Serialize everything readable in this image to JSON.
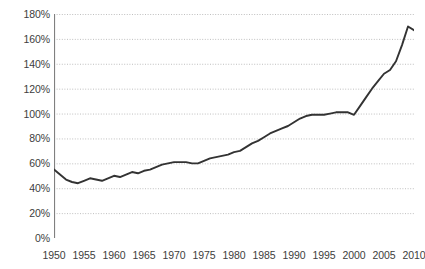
{
  "chart_data": {
    "type": "line",
    "title": "",
    "subtitle": "",
    "xlabel": "",
    "ylabel": "",
    "xlim": [
      1950,
      2010
    ],
    "ylim": [
      0,
      180
    ],
    "ytick_step": 20,
    "ytick_labels": [
      "0%",
      "20%",
      "40%",
      "60%",
      "80%",
      "100%",
      "120%",
      "140%",
      "160%",
      "180%"
    ],
    "ytick_values": [
      0,
      20,
      40,
      60,
      80,
      100,
      120,
      140,
      160,
      180
    ],
    "xtick_labels": [
      "1950",
      "1955",
      "1960",
      "1965",
      "1970",
      "1975",
      "1980",
      "1985",
      "1990",
      "1995",
      "2000",
      "2005",
      "2010"
    ],
    "xtick_values": [
      1950,
      1955,
      1960,
      1965,
      1970,
      1975,
      1980,
      1985,
      1990,
      1995,
      2000,
      2005,
      2010
    ],
    "xminor_tick_step": 1,
    "grid": "horizontal-dotted",
    "legend": "none",
    "line_color": "#333333",
    "grid_color": "#bfbfbf",
    "axis_color": "#808080",
    "text_color": "#3d3d3d",
    "x": [
      1950,
      1951,
      1952,
      1953,
      1954,
      1955,
      1956,
      1957,
      1958,
      1959,
      1960,
      1961,
      1962,
      1963,
      1964,
      1965,
      1966,
      1967,
      1968,
      1969,
      1970,
      1971,
      1972,
      1973,
      1974,
      1975,
      1976,
      1977,
      1978,
      1979,
      1980,
      1981,
      1982,
      1983,
      1984,
      1985,
      1986,
      1987,
      1988,
      1989,
      1990,
      1991,
      1992,
      1993,
      1994,
      1995,
      1996,
      1997,
      1998,
      1999,
      2000,
      2001,
      2002,
      2003,
      2004,
      2005,
      2006,
      2007,
      2008,
      2009,
      2010
    ],
    "series": [
      {
        "name": "Ratio",
        "values": [
          55,
          51,
          47,
          45,
          44,
          46,
          48,
          47,
          46,
          48,
          50,
          49,
          51,
          53,
          52,
          54,
          55,
          57,
          59,
          60,
          61,
          61,
          61,
          60,
          60,
          62,
          64,
          65,
          66,
          67,
          69,
          70,
          73,
          76,
          78,
          81,
          84,
          86,
          88,
          90,
          93,
          96,
          98,
          99,
          99,
          99,
          100,
          101,
          101,
          101,
          99,
          106,
          113,
          120,
          126,
          132,
          135,
          142,
          155,
          170,
          167
        ]
      }
    ]
  }
}
